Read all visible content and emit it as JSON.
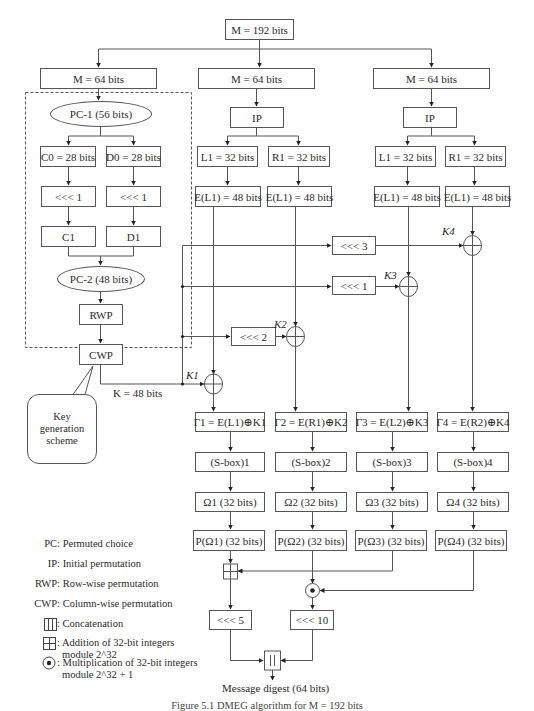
{
  "diagram": {
    "input": "M = 192 bits",
    "branches": {
      "left": {
        "label": "M = 64 bits"
      },
      "middle": {
        "label": "M = 64 bits"
      },
      "right": {
        "label": "M = 64 bits"
      }
    },
    "key_scheme": {
      "pc1": "PC-1 (56 bits)",
      "c0": "C0 = 28 bits",
      "d0": "D0 = 28 bits",
      "shift_c": "<<< 1",
      "shift_d": "<<< 1",
      "c1": "C1",
      "d1": "D1",
      "pc2": "PC-2 (48 bits)",
      "rwp": "RWP",
      "cwp": "CWP",
      "key_output": "K = 48 bits",
      "callout": "Key\ngeneration\nscheme"
    },
    "middle_block": {
      "ip": "IP",
      "l1": "L1 = 32 bits",
      "r1": "R1 = 32 bits",
      "el": "E(L1) = 48 bits",
      "er": "E(L1) = 48 bits"
    },
    "right_block": {
      "ip": "IP",
      "l1": "L1 = 32 bits",
      "r1": "R1 = 32 bits",
      "el": "E(L1) = 48 bits",
      "er": "E(L1) = 48 bits"
    },
    "key_shifts": {
      "k4_shift": "<<< 3",
      "k3_shift": "<<< 1",
      "k2_shift": "<<< 2"
    },
    "keys": [
      "K1",
      "K2",
      "K3",
      "K4"
    ],
    "gammas": [
      "Γ1 = E(L1)⊕K1",
      "Γ2 = E(R1)⊕K2",
      "Γ3 = E(L2)⊕K3",
      "Γ4 = E(R2)⊕K4"
    ],
    "sboxes": [
      "(S-box)1",
      "(S-box)2",
      "(S-box)3",
      "(S-box)4"
    ],
    "omegas": [
      "Ω1 (32 bits)",
      "Ω2 (32 bits)",
      "Ω3 (32 bits)",
      "Ω4 (32 bits)"
    ],
    "perms": [
      "P(Ω1) (32 bits)",
      "P(Ω2) (32 bits)",
      "P(Ω3) (32 bits)",
      "P(Ω4) (32 bits)"
    ],
    "final_shifts": {
      "left": "<<< 5",
      "right": "<<< 10"
    },
    "concat_symbol": "| |",
    "output": "Message digest (64 bits)"
  },
  "legend": [
    {
      "key": "PC:",
      "text": "Permuted choice"
    },
    {
      "key": "IP:",
      "text": "Initial permutation"
    },
    {
      "key": "RWP:",
      "text": "Row-wise permutation"
    },
    {
      "key": "CWP:",
      "text": "Column-wise permutation"
    },
    {
      "key": "concat-symbol",
      "text": ": Concatenation"
    },
    {
      "key": "add-symbol",
      "text": ": Addition of 32-bit integers",
      "text2": "module 2^32"
    },
    {
      "key": "mul-symbol",
      "text": ": Multiplication of 32-bit integers",
      "text2": "module 2^32 + 1"
    }
  ],
  "caption": "Figure 5.1  DMEG algorithm for M = 192 bits"
}
